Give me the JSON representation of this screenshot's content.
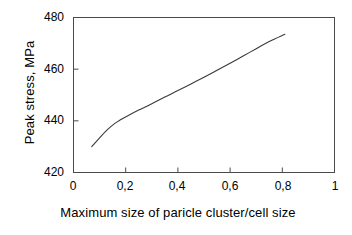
{
  "chart_data": {
    "type": "line",
    "title": "",
    "xlabel": "Maximum size of paricle cluster/cell size",
    "ylabel": "Peak stress, MPa",
    "xlim": [
      0,
      1
    ],
    "ylim": [
      420,
      480
    ],
    "grid": false,
    "legend": "none",
    "x_tick_labels": [
      "0",
      "0,2",
      "0,4",
      "0,6",
      "0,8",
      "1"
    ],
    "x_tick_values": [
      0,
      0.2,
      0.4,
      0.6,
      0.8,
      1
    ],
    "y_tick_labels": [
      "420",
      "440",
      "460",
      "480"
    ],
    "y_tick_values": [
      420,
      440,
      460,
      480
    ],
    "series": [
      {
        "name": "Peak stress",
        "color": "#3a3a3a",
        "x": [
          0.07,
          0.1,
          0.13,
          0.16,
          0.18,
          0.21,
          0.25,
          0.3,
          0.35,
          0.4,
          0.45,
          0.5,
          0.55,
          0.6,
          0.65,
          0.7,
          0.75,
          0.81
        ],
        "y": [
          430.0,
          433.4,
          436.6,
          439.1,
          440.4,
          442.1,
          444.2,
          446.6,
          449.2,
          451.7,
          454.3,
          456.9,
          459.6,
          462.3,
          465.1,
          467.9,
          470.7,
          473.5
        ]
      }
    ]
  },
  "axes": {
    "y_title": "Peak stress, MPa",
    "x_title": "Maximum size of paricle cluster/cell size",
    "y_ticks": [
      {
        "label": "480"
      },
      {
        "label": "460"
      },
      {
        "label": "440"
      },
      {
        "label": "420"
      }
    ],
    "x_ticks": [
      {
        "label": "0"
      },
      {
        "label": "0,2"
      },
      {
        "label": "0,4"
      },
      {
        "label": "0,6"
      },
      {
        "label": "0,8"
      },
      {
        "label": "1"
      }
    ]
  },
  "style": {
    "frame_color": "#4a4a4a",
    "curve_color": "#3a3a3a",
    "background": "#ffffff"
  }
}
